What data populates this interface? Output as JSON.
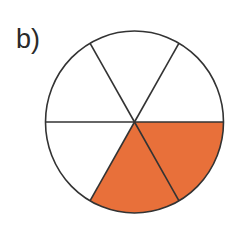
{
  "label": "b)",
  "diagram": {
    "type": "fraction-circle",
    "total_sectors": 6,
    "shaded_sectors": 2,
    "fraction": "2/6",
    "shaded_sector_indices": [
      0,
      1
    ],
    "colors": {
      "shaded": "#E8703A",
      "unshaded": "#FFFFFF",
      "stroke": "#333333"
    }
  }
}
